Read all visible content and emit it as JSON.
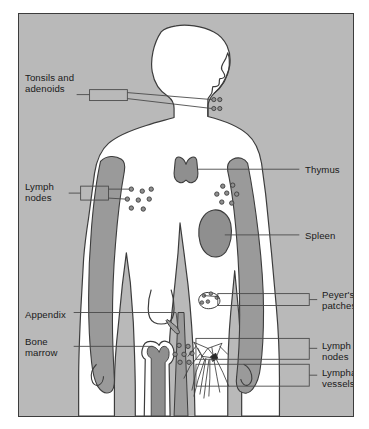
{
  "figure": {
    "colors": {
      "panel_background": "#b9b9b9",
      "body_fill": "#ffffff",
      "shaded_fill": "#9a9a9a",
      "outline": "#3c3c3c",
      "leader_line": "#4a4a4a",
      "text": "#1a1a1a",
      "page_background": "#ffffff"
    }
  },
  "labels": {
    "tonsils_adenoids": "Tonsils and\nadenoids",
    "lymph_nodes_left": "Lymph\nnodes",
    "appendix": "Appendix",
    "bone_marrow": "Bone\nmarrow",
    "thymus": "Thymus",
    "spleen": "Spleen",
    "peyers_patches": "Peyer's\npatches",
    "lymph_nodes_right": "Lymph\nnodes",
    "lymphatic_vessels": "Lymphatic\nvessels"
  },
  "callouts": [
    {
      "id": "tonsils-adenoids",
      "label": "Tonsils and\nadenoids",
      "side": "left",
      "marker": "paired-circles"
    },
    {
      "id": "lymph-nodes-axillary",
      "label": "Lymph\nnodes",
      "side": "left",
      "marker": "node-cluster"
    },
    {
      "id": "appendix",
      "label": "Appendix",
      "side": "left",
      "marker": "leader-line"
    },
    {
      "id": "bone-marrow",
      "label": "Bone\nmarrow",
      "side": "left",
      "marker": "leader-line"
    },
    {
      "id": "thymus",
      "label": "Thymus",
      "side": "right",
      "marker": "leader-line"
    },
    {
      "id": "spleen",
      "label": "Spleen",
      "side": "right",
      "marker": "leader-line"
    },
    {
      "id": "peyers-patches",
      "label": "Peyer's\npatches",
      "side": "right",
      "marker": "callout-box"
    },
    {
      "id": "lymph-nodes-inguinal",
      "label": "Lymph\nnodes",
      "side": "right",
      "marker": "callout-box"
    },
    {
      "id": "lymphatic-vessels",
      "label": "Lymphatic\nvessels",
      "side": "right",
      "marker": "callout-box"
    }
  ]
}
